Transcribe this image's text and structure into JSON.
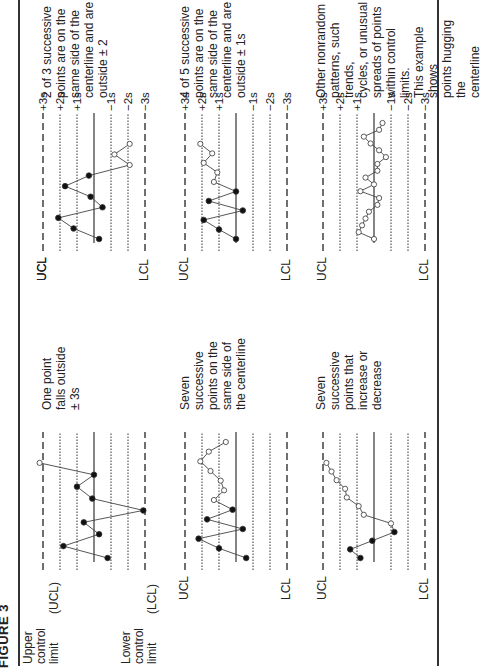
{
  "figure": {
    "title": "FIGURE 3",
    "legend": {
      "upper": [
        "Upper",
        "control",
        "limit"
      ],
      "upper_abbr": "(UCL)",
      "lower": [
        "Lower",
        "control",
        "limit"
      ],
      "lower_abbr": "(LCL)"
    },
    "sigma_labels": [
      "+3s",
      "+2s",
      "+1s",
      "",
      "−1s",
      "−2s",
      "−3s"
    ],
    "ucl_label": "UCL",
    "lcl_label": "LCL",
    "colors": {
      "ink": "#222222",
      "line": "#333333",
      "background": "#ffffff"
    }
  },
  "chart_data": [
    {
      "type": "line",
      "title": "One point falls outside ± 3s",
      "description": [
        "One point",
        "falls outside",
        "± 3s"
      ],
      "y_levels": [
        "+3s",
        "+2s",
        "+1s",
        "center",
        "-1s",
        "-2s",
        "-3s"
      ],
      "ylim": [
        -3,
        3
      ],
      "x": [
        1,
        2,
        3,
        4,
        5,
        6,
        7,
        8,
        9
      ],
      "values": [
        -0.8,
        1.8,
        -0.3,
        0.6,
        -2.9,
        0.1,
        1.0,
        0.0,
        3.2
      ],
      "open_points": [
        9
      ]
    },
    {
      "type": "line",
      "title": "Seven successive points on the same side of the centerline",
      "description": [
        "Seven",
        "successive",
        "points on the",
        "same side of",
        "the centerline"
      ],
      "y_levels": [
        "+3s",
        "+2s",
        "+1s",
        "center",
        "-1s",
        "-2s",
        "-3s"
      ],
      "ylim": [
        -3,
        3
      ],
      "x": [
        1,
        2,
        3,
        4,
        5,
        6,
        7,
        8,
        9,
        10,
        11,
        12,
        13
      ],
      "values": [
        -0.6,
        1.0,
        2.2,
        -0.4,
        1.7,
        0.2,
        1.3,
        0.7,
        0.9,
        1.5,
        2.1,
        1.6,
        0.6
      ],
      "open_points": [
        7,
        8,
        9,
        10,
        11,
        12,
        13
      ]
    },
    {
      "type": "line",
      "title": "Seven successive points that increase or decrease",
      "description": [
        "Seven",
        "successive",
        "points that",
        "increase or",
        "decrease"
      ],
      "y_levels": [
        "+3s",
        "+2s",
        "+1s",
        "center",
        "-1s",
        "-2s",
        "-3s"
      ],
      "ylim": [
        -3,
        3
      ],
      "x": [
        1,
        2,
        3,
        4,
        5,
        6,
        7,
        8,
        9,
        10,
        11,
        12
      ],
      "values": [
        0.8,
        1.4,
        0.1,
        -1.2,
        -1.0,
        0.6,
        0.9,
        1.6,
        1.7,
        2.2,
        2.5,
        2.8
      ],
      "open_points": [
        5,
        6,
        7,
        8,
        9,
        10,
        11,
        12
      ]
    },
    {
      "type": "line",
      "title": "2 of 3 successive points are on the same side of the centerline and are outside ± 2",
      "description": [
        "2 of 3 successive",
        "points are on the",
        "same side of the",
        "centerline and are",
        "outside ± 2"
      ],
      "y_levels": [
        "+3s",
        "+2s",
        "+1s",
        "center",
        "-1s",
        "-2s",
        "-3s"
      ],
      "ylim": [
        -3,
        3
      ],
      "x": [
        1,
        2,
        3,
        4,
        5,
        6,
        7,
        8,
        9
      ],
      "values": [
        -0.3,
        1.2,
        2.1,
        -0.5,
        0.2,
        1.7,
        0.3,
        -2.1,
        -1.2,
        -2.1
      ],
      "open_points": [
        8,
        9,
        10
      ]
    },
    {
      "type": "line",
      "title": "4 of 5 successive points are on the same side of the centerline and are outside ± 1s",
      "description": [
        "4 of 5 successive",
        "points are on the",
        "same side of the",
        "centerline and are",
        "outside ± 1s"
      ],
      "y_levels": [
        "+3s",
        "+2s",
        "+1s",
        "center",
        "-1s",
        "-2s",
        "-3s"
      ],
      "ylim": [
        -3,
        3
      ],
      "x": [
        1,
        2,
        3,
        4,
        5,
        6,
        7,
        8,
        9,
        10
      ],
      "values": [
        0.0,
        1.0,
        1.9,
        -0.4,
        1.6,
        0.0,
        1.3,
        1.1,
        1.9,
        1.4,
        2.1
      ],
      "open_points": [
        7,
        8,
        9,
        10,
        11
      ]
    },
    {
      "type": "line",
      "title": "Other nonrandom patterns, such trends, cycles, or unusual spreads of points within control limits. This example shows points hugging the centerline",
      "description": [
        "Other nonrandom",
        "patterns, such trends,",
        "cycles, or unusual",
        "spreads of points",
        "within control limits.",
        "This example shows",
        "points hugging the",
        "centerline"
      ],
      "y_levels": [
        "+3s",
        "+2s",
        "+1s",
        "center",
        "-1s",
        "-2s",
        "-3s"
      ],
      "ylim": [
        -3,
        3
      ],
      "x": [
        1,
        2,
        3,
        4,
        5,
        6,
        7,
        8,
        9,
        10,
        11,
        12,
        13,
        14,
        15,
        16,
        17,
        18
      ],
      "values": [
        0.0,
        0.9,
        0.7,
        0.5,
        0.3,
        -0.2,
        -0.3,
        0.8,
        0.0,
        0.5,
        -0.2,
        -0.2,
        -0.7,
        -0.3,
        0.2,
        0.6,
        -0.3,
        -0.5
      ],
      "open_points": [
        1,
        2,
        3,
        4,
        5,
        6,
        7,
        8,
        9,
        10,
        11,
        12,
        13,
        14,
        15,
        16,
        17,
        18
      ]
    }
  ]
}
